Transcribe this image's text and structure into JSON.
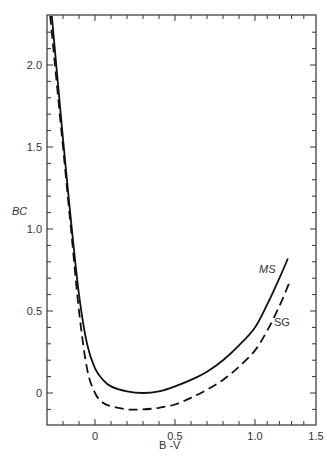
{
  "chart_data": {
    "type": "line",
    "title": "",
    "xlabel": "B -V",
    "ylabel": "BC",
    "xlim": [
      -0.3,
      1.5
    ],
    "ylim": [
      -0.2,
      2.3
    ],
    "grid": false,
    "legend": "inline labels near curve ends",
    "x_ticks": [
      0,
      0.5,
      1.0,
      1.5
    ],
    "x_tick_labels": [
      "0",
      "0.5",
      "1.0",
      "1.5"
    ],
    "y_ticks": [
      0,
      0.5,
      1.0,
      1.5,
      2.0
    ],
    "y_tick_labels": [
      "0",
      "0.5",
      "1.0",
      "1.5",
      "2.0"
    ],
    "series": [
      {
        "name": "MS",
        "style": "solid",
        "label_italic": true,
        "x": [
          -0.27,
          -0.2,
          -0.15,
          -0.1,
          -0.05,
          0.0,
          0.05,
          0.1,
          0.2,
          0.3,
          0.4,
          0.5,
          0.6,
          0.7,
          0.8,
          0.9,
          1.0,
          1.1,
          1.2,
          1.27
        ],
        "values": [
          2.3,
          1.55,
          1.05,
          0.6,
          0.3,
          0.15,
          0.08,
          0.04,
          0.01,
          0.0,
          0.01,
          0.04,
          0.08,
          0.13,
          0.2,
          0.29,
          0.4,
          0.54,
          0.7,
          0.82
        ]
      },
      {
        "name": "SG",
        "style": "dashed",
        "label_italic": false,
        "x": [
          -0.28,
          -0.2,
          -0.15,
          -0.1,
          -0.05,
          0.0,
          0.05,
          0.1,
          0.2,
          0.3,
          0.4,
          0.5,
          0.6,
          0.7,
          0.8,
          0.9,
          1.0,
          1.1,
          1.2,
          1.28
        ],
        "values": [
          2.3,
          1.5,
          1.0,
          0.5,
          0.15,
          0.0,
          -0.06,
          -0.08,
          -0.1,
          -0.1,
          -0.09,
          -0.07,
          -0.03,
          0.02,
          0.08,
          0.16,
          0.26,
          0.38,
          0.53,
          0.67
        ]
      }
    ]
  },
  "labels": {
    "ms": "MS",
    "sg": "SG",
    "xlabel": "B -V",
    "ylabel": "BC"
  }
}
